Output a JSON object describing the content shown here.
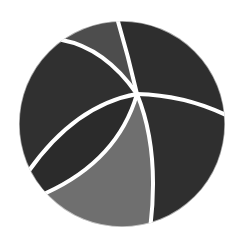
{
  "image": {
    "subject": "beach-ball-icon",
    "label": "Beach ball",
    "background": "#ffffff"
  },
  "ball": {
    "center": [
      122,
      124
    ],
    "radius": 103,
    "hub": [
      137,
      94
    ],
    "seam_color": "#ffffff",
    "seam_width": 4,
    "segments": [
      {
        "name": "top-panel",
        "color": "#4d4d4d"
      },
      {
        "name": "top-right-panel",
        "color": "#2e2e2e"
      },
      {
        "name": "upper-left-panel",
        "color": "#303030"
      },
      {
        "name": "left-wedge-panel",
        "color": "#2b2b2b"
      },
      {
        "name": "bottom-panel",
        "color": "#6f6f6f"
      },
      {
        "name": "right-panel",
        "color": "#2f2f2f"
      }
    ]
  }
}
